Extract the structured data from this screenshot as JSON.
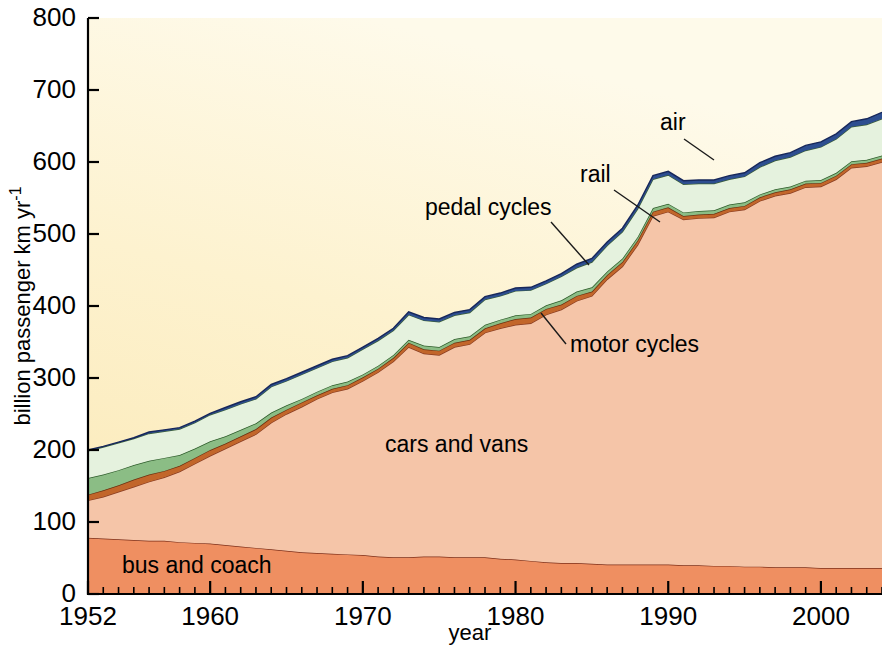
{
  "figure": {
    "plot_background_color": "#fcf4d8",
    "page_background_color": "#ffffff"
  },
  "axes": {
    "y": {
      "title": "billion passenger km yr",
      "title_superscript": "-1",
      "ticks": [
        0,
        100,
        200,
        300,
        400,
        500,
        600,
        700,
        800
      ],
      "tick_labels": [
        "0",
        "100",
        "200",
        "300",
        "400",
        "500",
        "600",
        "700",
        "800"
      ],
      "min": 0,
      "max": 800
    },
    "x": {
      "title": "year",
      "ticks": [
        1952,
        1960,
        1970,
        1980,
        1990,
        2000
      ],
      "tick_labels": [
        "1952",
        "1960",
        "1970",
        "1980",
        "1990",
        "2000"
      ],
      "min": 1952,
      "max": 2004,
      "minor_tick_interval": 1
    }
  },
  "annotations": [
    {
      "name": "air",
      "label": "air",
      "text_x": 660,
      "text_y": 130,
      "leader": [
        [
          684,
          139
        ],
        [
          714,
          160
        ]
      ]
    },
    {
      "name": "rail",
      "label": "rail",
      "text_x": 580,
      "text_y": 182,
      "leader": [
        [
          614,
          190
        ],
        [
          660,
          222
        ]
      ]
    },
    {
      "name": "pedal-cycles",
      "label": "pedal cycles",
      "text_x": 425,
      "text_y": 215,
      "leader": [
        [
          551,
          222
        ],
        [
          589,
          265
        ]
      ]
    },
    {
      "name": "motor-cycles",
      "label": "motor cycles",
      "text_x": 570,
      "text_y": 352,
      "leader": [
        [
          566,
          344
        ],
        [
          541,
          313
        ]
      ]
    },
    {
      "name": "cars-and-vans",
      "label": "cars and vans",
      "text_x": 385,
      "text_y": 452,
      "leader": null
    },
    {
      "name": "bus-and-coach",
      "label": "bus and coach",
      "text_x": 122,
      "text_y": 573,
      "leader": null
    }
  ],
  "chart_data": {
    "type": "area",
    "stacked": true,
    "title": "",
    "xlabel": "year",
    "ylabel": "billion passenger km yr-1",
    "xlim": [
      1952,
      2004
    ],
    "ylim": [
      0,
      800
    ],
    "grid": false,
    "legend": "inline-annotations",
    "x": [
      1952,
      1953,
      1954,
      1955,
      1956,
      1957,
      1958,
      1959,
      1960,
      1961,
      1962,
      1963,
      1964,
      1965,
      1966,
      1967,
      1968,
      1969,
      1970,
      1971,
      1972,
      1973,
      1974,
      1975,
      1976,
      1977,
      1978,
      1979,
      1980,
      1981,
      1982,
      1983,
      1984,
      1985,
      1986,
      1987,
      1988,
      1989,
      1990,
      1991,
      1992,
      1993,
      1994,
      1995,
      1996,
      1997,
      1998,
      1999,
      2000,
      2001,
      2002,
      2003,
      2004
    ],
    "series": [
      {
        "name": "bus and coach",
        "color": "#ef8f61",
        "outline_color": "#7d2f19",
        "values": [
          78,
          77,
          76,
          75,
          74,
          74,
          72,
          71,
          70,
          68,
          66,
          64,
          62,
          60,
          58,
          57,
          56,
          55,
          54,
          52,
          51,
          51,
          52,
          52,
          51,
          51,
          51,
          49,
          48,
          46,
          44,
          43,
          43,
          42,
          41,
          41,
          41,
          41,
          41,
          40,
          40,
          39,
          39,
          38,
          38,
          37,
          37,
          37,
          36,
          36,
          36,
          36,
          36
        ]
      },
      {
        "name": "cars and vans",
        "color": "#f5c5a8",
        "outline_color": "#8a3d22",
        "values": [
          52,
          58,
          66,
          74,
          82,
          88,
          98,
          110,
          122,
          134,
          146,
          158,
          176,
          190,
          202,
          214,
          224,
          230,
          242,
          256,
          272,
          292,
          282,
          280,
          292,
          296,
          312,
          320,
          326,
          330,
          344,
          352,
          364,
          372,
          396,
          414,
          444,
          484,
          490,
          480,
          482,
          484,
          492,
          496,
          508,
          516,
          520,
          528,
          530,
          540,
          556,
          558,
          564
        ]
      },
      {
        "name": "motor cycles",
        "color": "#c2662a",
        "outline_color": "#6b3110",
        "values": [
          8,
          9,
          9,
          10,
          10,
          9,
          8,
          8,
          8,
          7,
          7,
          7,
          7,
          6,
          6,
          5,
          5,
          5,
          5,
          5,
          5,
          6,
          6,
          6,
          6,
          6,
          6,
          7,
          8,
          8,
          8,
          7,
          7,
          6,
          6,
          6,
          6,
          6,
          6,
          5,
          5,
          5,
          5,
          5,
          5,
          5,
          5,
          5,
          5,
          5,
          5,
          5,
          5
        ]
      },
      {
        "name": "pedal cycles",
        "color": "#8bbd85",
        "outline_color": "#2f5d2c",
        "values": [
          23,
          22,
          21,
          20,
          19,
          18,
          15,
          13,
          12,
          10,
          9,
          8,
          7,
          6,
          5,
          5,
          5,
          5,
          4,
          4,
          4,
          4,
          5,
          5,
          5,
          5,
          5,
          5,
          5,
          5,
          5,
          6,
          6,
          6,
          5,
          5,
          5,
          5,
          5,
          5,
          5,
          5,
          5,
          5,
          4,
          4,
          4,
          4,
          4,
          4,
          4,
          4,
          4
        ]
      },
      {
        "name": "rail",
        "color": "#e5f2de",
        "outline_color": "#3b5f38",
        "values": [
          38,
          38,
          38,
          37,
          38,
          37,
          36,
          36,
          37,
          37,
          36,
          34,
          36,
          34,
          34,
          33,
          33,
          33,
          35,
          35,
          34,
          35,
          35,
          35,
          33,
          33,
          35,
          33,
          34,
          33,
          30,
          33,
          33,
          35,
          36,
          37,
          39,
          40,
          40,
          39,
          38,
          37,
          35,
          36,
          38,
          40,
          41,
          42,
          46,
          47,
          48,
          49,
          51
        ]
      },
      {
        "name": "air",
        "color": "#2d4e90",
        "outline_color": "#17275a",
        "values": [
          1,
          1,
          1,
          1,
          2,
          2,
          2,
          2,
          2,
          3,
          3,
          3,
          3,
          3,
          3,
          3,
          3,
          3,
          3,
          3,
          3,
          4,
          4,
          4,
          4,
          4,
          4,
          4,
          4,
          4,
          4,
          4,
          5,
          5,
          5,
          5,
          5,
          5,
          5,
          5,
          5,
          5,
          5,
          5,
          6,
          6,
          6,
          7,
          7,
          7,
          7,
          8,
          9
        ]
      }
    ]
  }
}
